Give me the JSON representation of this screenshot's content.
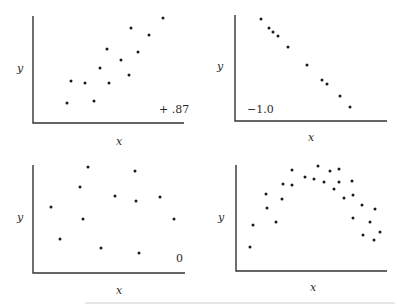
{
  "chart_data": [
    {
      "type": "scatter",
      "title": "",
      "xlabel": "x",
      "ylabel": "y",
      "annotation": "+ .87",
      "grid": false,
      "axis_ranges": {
        "x": [
          0,
          150
        ],
        "y": [
          0,
          107
        ]
      },
      "points": [
        [
          34,
          20
        ],
        [
          38,
          42
        ],
        [
          52,
          40
        ],
        [
          61,
          22
        ],
        [
          67,
          55
        ],
        [
          74,
          74
        ],
        [
          76,
          40
        ],
        [
          88,
          63
        ],
        [
          96,
          48
        ],
        [
          98,
          95
        ],
        [
          105,
          71
        ],
        [
          116,
          88
        ],
        [
          130,
          105
        ]
      ]
    },
    {
      "type": "scatter",
      "title": "",
      "xlabel": "x",
      "ylabel": "y",
      "annotation": "−1.0",
      "grid": false,
      "axis_ranges": {
        "x": [
          0,
          150
        ],
        "y": [
          0,
          106
        ]
      },
      "points": [
        [
          26,
          102
        ],
        [
          34,
          93
        ],
        [
          38,
          89
        ],
        [
          43,
          85
        ],
        [
          53,
          74
        ],
        [
          72,
          56
        ],
        [
          87,
          41
        ],
        [
          92,
          37
        ],
        [
          105,
          25
        ],
        [
          115,
          14
        ]
      ]
    },
    {
      "type": "scatter",
      "title": "",
      "xlabel": "x",
      "ylabel": "y",
      "annotation": "0",
      "grid": false,
      "axis_ranges": {
        "x": [
          0,
          152
        ],
        "y": [
          0,
          108
        ]
      },
      "points": [
        [
          18,
          66
        ],
        [
          27,
          34
        ],
        [
          47,
          86
        ],
        [
          50,
          54
        ],
        [
          55,
          106
        ],
        [
          68,
          25
        ],
        [
          82,
          77
        ],
        [
          102,
          102
        ],
        [
          103,
          72
        ],
        [
          106,
          20
        ],
        [
          127,
          76
        ],
        [
          141,
          54
        ]
      ]
    },
    {
      "type": "scatter",
      "title": "",
      "xlabel": "x",
      "ylabel": "y",
      "annotation": "",
      "grid": false,
      "axis_ranges": {
        "x": [
          0,
          151
        ],
        "y": [
          0,
          106
        ]
      },
      "points": [
        [
          14,
          24
        ],
        [
          17,
          46
        ],
        [
          30,
          77
        ],
        [
          31,
          63
        ],
        [
          40,
          49
        ],
        [
          46,
          72
        ],
        [
          47,
          87
        ],
        [
          56,
          101
        ],
        [
          56,
          86
        ],
        [
          69,
          94
        ],
        [
          78,
          92
        ],
        [
          82,
          105
        ],
        [
          88,
          89
        ],
        [
          94,
          100
        ],
        [
          98,
          82
        ],
        [
          103,
          102
        ],
        [
          103,
          89
        ],
        [
          108,
          73
        ],
        [
          116,
          90
        ],
        [
          117,
          76
        ],
        [
          117,
          53
        ],
        [
          126,
          66
        ],
        [
          127,
          36
        ],
        [
          134,
          49
        ],
        [
          139,
          62
        ],
        [
          138,
          31
        ],
        [
          144,
          39
        ]
      ]
    }
  ],
  "panels": [
    {
      "xlabel": "x",
      "ylabel": "y",
      "annotation": "+ .87"
    },
    {
      "xlabel": "x",
      "ylabel": "y",
      "annotation": "−1.0"
    },
    {
      "xlabel": "x",
      "ylabel": "y",
      "annotation": "0"
    },
    {
      "xlabel": "x",
      "ylabel": "y",
      "annotation": ""
    }
  ]
}
